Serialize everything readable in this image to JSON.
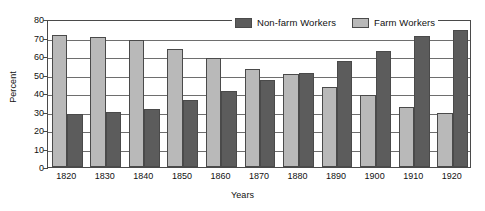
{
  "chart_data": {
    "type": "bar",
    "title": "",
    "xlabel": "Years",
    "ylabel": "Percent",
    "ylim": [
      0,
      80
    ],
    "yticks": [
      0,
      10,
      20,
      30,
      40,
      50,
      60,
      70,
      80
    ],
    "grid": true,
    "legend_position": "top-inside",
    "categories": [
      "1820",
      "1830",
      "1840",
      "1850",
      "1860",
      "1870",
      "1880",
      "1890",
      "1900",
      "1910",
      "1920"
    ],
    "series": [
      {
        "name": "Farm Workers",
        "color": "#b9b9b9",
        "values": [
          71.5,
          70.5,
          68.5,
          64,
          59,
          53,
          50.5,
          43,
          39,
          32.5,
          29
        ]
      },
      {
        "name": "Non-farm Workers",
        "color": "#5c5c5c",
        "values": [
          28.5,
          29.5,
          31.5,
          36,
          41,
          47,
          51,
          57.5,
          62.5,
          71,
          74
        ]
      }
    ]
  },
  "legend": {
    "entries": [
      {
        "label": "Non-farm Workers",
        "swatch": "nonfarm"
      },
      {
        "label": "Farm Workers",
        "swatch": "farm"
      }
    ]
  },
  "axes": {
    "y_title": "Percent",
    "x_title": "Years"
  }
}
